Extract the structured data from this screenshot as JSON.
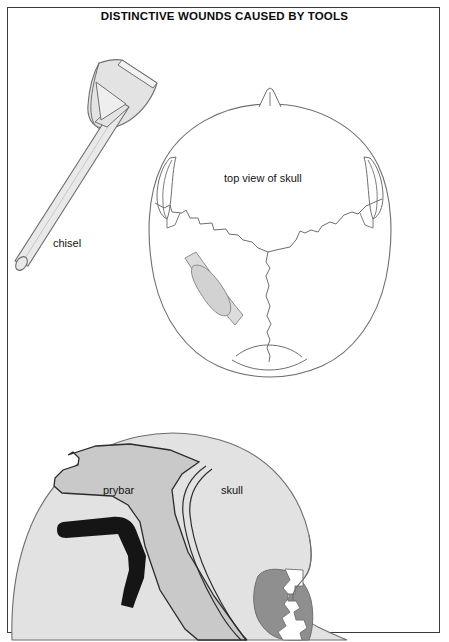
{
  "figure": {
    "title": "DISTINCTIVE WOUNDS CAUSED BY TOOLS",
    "border_color": "#3a3a3a",
    "background": "#ffffff"
  },
  "palette": {
    "outline": "#6e6e6e",
    "outline_dark": "#2b2b2b",
    "tool_fill": "#e3e3e3",
    "bone_light": "#e2e2e2",
    "prybar_fill": "#c9c9c9",
    "orbit_fill": "#8f8f8f",
    "wound_black": "#151515",
    "text": "#141414"
  },
  "panels": {
    "chisel_tool": {
      "label": "chisel",
      "name": "chisel-tool",
      "description": "long tapered shaft with fan-shaped beveled blade head"
    },
    "skull_top": {
      "label": "top view of skull",
      "name": "skull-top-view",
      "features": [
        "nasal-protrusion",
        "left-ear-crescent",
        "right-ear-crescent",
        "coronal-suture",
        "sagittal-fracture",
        "chisel-wound",
        "foramen-magnum"
      ]
    },
    "skull_profile": {
      "labels": {
        "prybar": "prybar",
        "skull": "skull"
      },
      "name": "skull-profile-view",
      "features": [
        "cranial-vault",
        "prybar-overlay",
        "prybar-wound-mark",
        "orbit-socket",
        "orbit-fracture"
      ]
    }
  }
}
